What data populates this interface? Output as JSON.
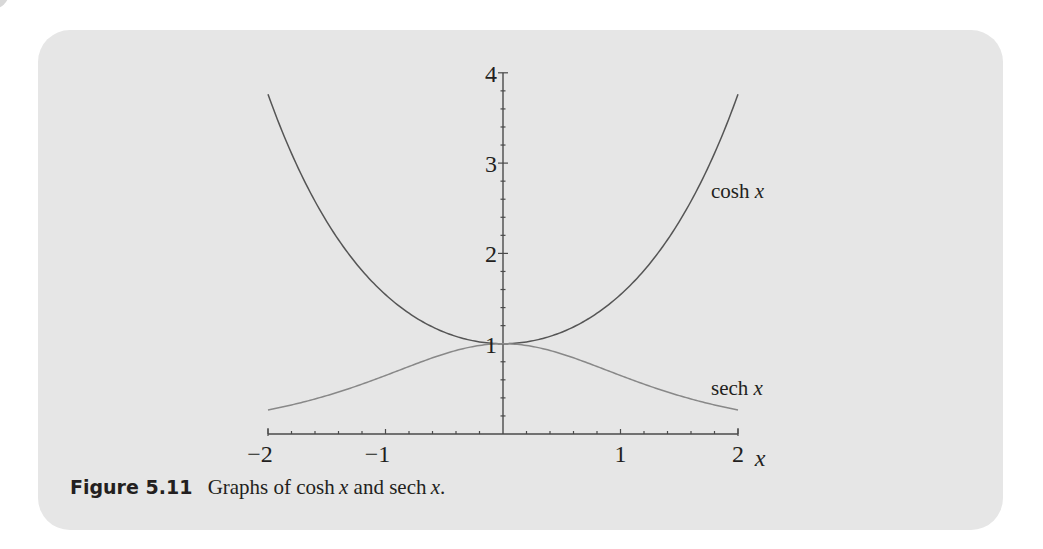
{
  "figure": {
    "label": "Figure 5.11",
    "caption_parts": [
      "Graphs of cosh",
      "x",
      "and sech",
      "x",
      "."
    ]
  },
  "chart_data": {
    "type": "line",
    "xlabel": "x",
    "ylabel": "",
    "xlim": [
      -2,
      2
    ],
    "ylim": [
      0,
      4
    ],
    "grid": false,
    "legend": "inline labels at right ends of curves",
    "x_ticks": {
      "major": [
        -2,
        -1,
        1,
        2
      ],
      "labels": [
        "−2",
        "−1",
        "1",
        "2"
      ],
      "minor_step": 0.2
    },
    "y_ticks": {
      "major": [
        1,
        2,
        3,
        4
      ],
      "labels": [
        "1",
        "2",
        "3",
        "4"
      ],
      "minor_step": 0.2
    },
    "x": [
      -2.0,
      -1.8,
      -1.6,
      -1.4,
      -1.2,
      -1.0,
      -0.8,
      -0.6,
      -0.4,
      -0.2,
      0.0,
      0.2,
      0.4,
      0.6,
      0.8,
      1.0,
      1.2,
      1.4,
      1.6,
      1.8,
      2.0
    ],
    "series": [
      {
        "name": "cosh x",
        "label": "cosh",
        "label_var": "x",
        "color": "#555555",
        "values": [
          3.762,
          3.107,
          2.577,
          2.151,
          1.811,
          1.543,
          1.337,
          1.185,
          1.081,
          1.02,
          1.0,
          1.02,
          1.081,
          1.185,
          1.337,
          1.543,
          1.811,
          2.151,
          2.577,
          3.107,
          3.762
        ]
      },
      {
        "name": "sech x",
        "label": "sech",
        "label_var": "x",
        "color": "#888888",
        "values": [
          0.266,
          0.322,
          0.388,
          0.465,
          0.552,
          0.648,
          0.748,
          0.844,
          0.925,
          0.98,
          1.0,
          0.98,
          0.925,
          0.844,
          0.748,
          0.648,
          0.552,
          0.465,
          0.388,
          0.322,
          0.266
        ]
      }
    ]
  }
}
